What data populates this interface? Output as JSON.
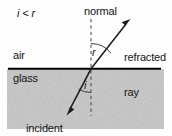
{
  "figure": {
    "width": 172,
    "height": 136,
    "background_color": "#ffffff"
  },
  "labels": {
    "inequality": "i < r",
    "normal": "normal",
    "refracted_ray_line1": "refracted",
    "refracted_ray_line2": "ray",
    "incident_ray_line1": "incident",
    "incident_ray_line2": "ray",
    "medium_upper": "air",
    "medium_lower": "glass",
    "angle_refraction": "r",
    "angle_incidence": "i"
  },
  "colors": {
    "ink": "#141414",
    "boundary_line": "#000000",
    "glass_fill": "#c9c9c9",
    "normal_dash": "#4a4a4a",
    "background": "#ffffff"
  },
  "geometry": {
    "boundary_y": 69,
    "boundary_x_start": 8,
    "boundary_x_end": 161,
    "normal_x": 91,
    "normal_y_top": 19,
    "normal_y_bottom": 116,
    "incidence_point": [
      91,
      69
    ],
    "refracted_ray_end": [
      130,
      21
    ],
    "incident_ray_end": [
      67,
      112
    ],
    "glass_region_top": 69,
    "glass_region_bottom": 129
  },
  "icons": {
    "refracted_arrow": "arrowhead-up-right-icon",
    "incident_arrow": "arrowhead-down-left-icon",
    "angle_arc_r": "angle-arc-icon",
    "angle_arc_i": "angle-arc-icon"
  }
}
